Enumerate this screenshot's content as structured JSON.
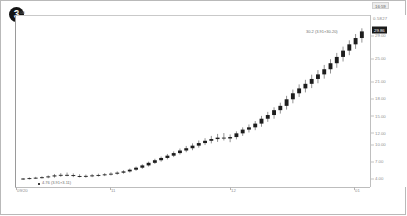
{
  "chart": {
    "badge_label": "3",
    "corner_label": "1.00"
  },
  "price_axis": {
    "header": "0.5827",
    "current_price": "29.86",
    "ticks": [
      "29.00",
      "25.00",
      "21.00",
      "18.00",
      "15.00",
      "12.00",
      "10.00",
      "7.00",
      "4.00"
    ]
  },
  "time_axis": {
    "ticks": [
      "09/20",
      "11",
      "12",
      "01"
    ],
    "current_time": "16:59"
  },
  "annotations": {
    "top_right": "30.2 (3.91×30.20)",
    "bottom_left": "4.76 (3.91×3.11)"
  },
  "chart_data": {
    "type": "candlestick",
    "title": "",
    "xlabel": "",
    "ylabel": "",
    "ylim": [
      3.2,
      31.5
    ],
    "grid": false,
    "legend": "none",
    "x_tick_labels": [
      "09/20",
      "11",
      "12",
      "01"
    ],
    "y_tick_values": [
      29,
      25,
      21,
      18,
      15,
      12,
      10,
      7,
      4
    ],
    "candles": [
      {
        "o": 4.05,
        "h": 4.25,
        "l": 3.9,
        "c": 4.15
      },
      {
        "o": 4.15,
        "h": 4.35,
        "l": 4.0,
        "c": 4.22
      },
      {
        "o": 4.22,
        "h": 4.45,
        "l": 4.1,
        "c": 4.3
      },
      {
        "o": 4.3,
        "h": 4.55,
        "l": 4.15,
        "c": 4.38
      },
      {
        "o": 4.38,
        "h": 4.7,
        "l": 4.2,
        "c": 4.52
      },
      {
        "o": 4.52,
        "h": 4.95,
        "l": 4.3,
        "c": 4.7
      },
      {
        "o": 4.7,
        "h": 5.1,
        "l": 4.45,
        "c": 4.8
      },
      {
        "o": 4.8,
        "h": 5.2,
        "l": 4.55,
        "c": 4.75
      },
      {
        "o": 4.75,
        "h": 5.05,
        "l": 4.4,
        "c": 4.6
      },
      {
        "o": 4.6,
        "h": 4.9,
        "l": 4.35,
        "c": 4.55
      },
      {
        "o": 4.55,
        "h": 4.85,
        "l": 4.3,
        "c": 4.62
      },
      {
        "o": 4.62,
        "h": 4.95,
        "l": 4.4,
        "c": 4.7
      },
      {
        "o": 4.7,
        "h": 5.0,
        "l": 4.5,
        "c": 4.78
      },
      {
        "o": 4.78,
        "h": 5.1,
        "l": 4.58,
        "c": 4.88
      },
      {
        "o": 4.88,
        "h": 5.25,
        "l": 4.68,
        "c": 5.0
      },
      {
        "o": 5.0,
        "h": 5.4,
        "l": 4.82,
        "c": 5.18
      },
      {
        "o": 5.18,
        "h": 5.6,
        "l": 5.0,
        "c": 5.4
      },
      {
        "o": 5.4,
        "h": 5.9,
        "l": 5.2,
        "c": 5.7
      },
      {
        "o": 5.7,
        "h": 6.25,
        "l": 5.5,
        "c": 6.05
      },
      {
        "o": 6.05,
        "h": 6.65,
        "l": 5.85,
        "c": 6.45
      },
      {
        "o": 6.45,
        "h": 7.1,
        "l": 6.25,
        "c": 6.9
      },
      {
        "o": 6.9,
        "h": 7.6,
        "l": 6.7,
        "c": 7.35
      },
      {
        "o": 7.35,
        "h": 8.0,
        "l": 7.1,
        "c": 7.75
      },
      {
        "o": 7.75,
        "h": 8.45,
        "l": 7.5,
        "c": 8.15
      },
      {
        "o": 8.15,
        "h": 8.9,
        "l": 7.9,
        "c": 8.6
      },
      {
        "o": 8.6,
        "h": 9.4,
        "l": 8.35,
        "c": 9.05
      },
      {
        "o": 9.05,
        "h": 9.85,
        "l": 8.75,
        "c": 9.45
      },
      {
        "o": 9.45,
        "h": 10.3,
        "l": 9.1,
        "c": 9.9
      },
      {
        "o": 9.9,
        "h": 10.8,
        "l": 9.55,
        "c": 10.35
      },
      {
        "o": 10.35,
        "h": 11.2,
        "l": 10.0,
        "c": 10.75
      },
      {
        "o": 10.75,
        "h": 11.6,
        "l": 10.3,
        "c": 11.05
      },
      {
        "o": 11.05,
        "h": 11.95,
        "l": 10.55,
        "c": 11.3
      },
      {
        "o": 11.3,
        "h": 12.1,
        "l": 10.8,
        "c": 11.15
      },
      {
        "o": 11.15,
        "h": 11.85,
        "l": 10.5,
        "c": 11.4
      },
      {
        "o": 11.4,
        "h": 12.4,
        "l": 11.0,
        "c": 12.05
      },
      {
        "o": 12.05,
        "h": 13.1,
        "l": 11.6,
        "c": 12.7
      },
      {
        "o": 12.7,
        "h": 13.6,
        "l": 12.2,
        "c": 13.1
      },
      {
        "o": 13.1,
        "h": 14.2,
        "l": 12.6,
        "c": 13.75
      },
      {
        "o": 13.75,
        "h": 15.1,
        "l": 13.2,
        "c": 14.6
      },
      {
        "o": 14.6,
        "h": 15.8,
        "l": 14.05,
        "c": 15.25
      },
      {
        "o": 15.25,
        "h": 16.6,
        "l": 14.6,
        "c": 16.1
      },
      {
        "o": 16.1,
        "h": 17.4,
        "l": 15.5,
        "c": 16.85
      },
      {
        "o": 16.85,
        "h": 18.6,
        "l": 16.2,
        "c": 18.0
      },
      {
        "o": 18.0,
        "h": 19.7,
        "l": 17.3,
        "c": 19.05
      },
      {
        "o": 19.05,
        "h": 20.6,
        "l": 18.4,
        "c": 19.9
      },
      {
        "o": 19.9,
        "h": 21.4,
        "l": 19.2,
        "c": 20.7
      },
      {
        "o": 20.7,
        "h": 22.3,
        "l": 19.95,
        "c": 21.55
      },
      {
        "o": 21.55,
        "h": 23.1,
        "l": 20.8,
        "c": 22.35
      },
      {
        "o": 22.35,
        "h": 24.0,
        "l": 21.6,
        "c": 23.25
      },
      {
        "o": 23.25,
        "h": 25.0,
        "l": 22.5,
        "c": 24.3
      },
      {
        "o": 24.3,
        "h": 26.1,
        "l": 23.5,
        "c": 25.4
      },
      {
        "o": 25.4,
        "h": 27.2,
        "l": 24.6,
        "c": 26.5
      },
      {
        "o": 26.5,
        "h": 28.3,
        "l": 25.7,
        "c": 27.6
      },
      {
        "o": 27.6,
        "h": 29.4,
        "l": 26.8,
        "c": 28.7
      },
      {
        "o": 28.7,
        "h": 30.4,
        "l": 27.9,
        "c": 29.86
      }
    ]
  }
}
